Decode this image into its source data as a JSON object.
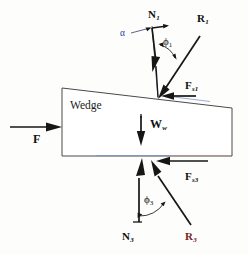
{
  "figure": {
    "body_label": "Wedge"
  },
  "labels": {
    "normal_top": "N",
    "normal_top_sub": "1",
    "resultant_top": "R",
    "resultant_top_sub": "1",
    "friction_top": "F",
    "friction_top_sub": "s1",
    "applied_force": "F",
    "weight": "W",
    "weight_sub": "w",
    "friction_bottom": "F",
    "friction_bottom_sub": "s3",
    "normal_bottom": "N",
    "normal_bottom_sub": "3",
    "resultant_bottom": "R",
    "resultant_bottom_sub": "3",
    "angle_phi1": "ϕ",
    "angle_phi1_sub": "1",
    "angle_phi3": "ϕ",
    "angle_phi3_sub": "3",
    "angle_alpha": "α"
  },
  "colors": {
    "ink": "#161616",
    "outline": "#4a4a4a",
    "alpha_blue": "#2b3fa0",
    "r3_red": "#7a2222",
    "background": "#fdfdfc"
  },
  "geometry": {
    "wedge_points": "62,88 232,108 232,156 62,156",
    "top_contact": [
      158,
      98
    ],
    "bottom_contact": [
      152,
      157
    ],
    "wedge_taper_note": "top edge slopes down to the right"
  }
}
